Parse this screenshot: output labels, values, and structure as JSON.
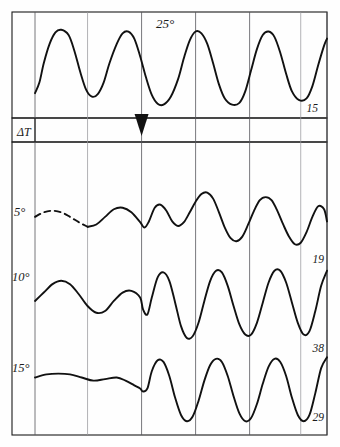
{
  "figure": {
    "background": "#fefefe",
    "ink_color": "#111111",
    "grid_color": "#55555a"
  },
  "chart_data": {
    "type": "line",
    "title": "",
    "xlabel": "",
    "ylabel": "",
    "grid": true,
    "legend": "none",
    "panels": [
      {
        "name": "upper-panel",
        "trace_label": "25°",
        "right_label": "15",
        "xlim": [
          0,
          100
        ],
        "ylim": [
          0,
          1
        ],
        "cycles": 6,
        "description": "regular high-amplitude oscillation",
        "points_x": [
          0,
          1.5,
          3,
          5,
          7,
          9,
          11.5,
          13.5,
          15.5,
          17.5,
          19.5,
          21.5,
          23.5,
          25.5,
          28,
          30,
          32,
          34,
          36,
          38,
          40,
          42,
          44,
          46.5,
          49,
          51,
          53,
          55,
          57,
          59,
          61,
          63,
          65,
          67.5,
          70,
          72,
          74,
          76,
          78,
          80,
          82,
          84,
          86,
          88,
          90.5,
          93,
          95,
          97,
          99,
          100
        ],
        "points_y": [
          0.18,
          0.3,
          0.52,
          0.74,
          0.87,
          0.9,
          0.84,
          0.66,
          0.42,
          0.22,
          0.14,
          0.17,
          0.3,
          0.52,
          0.74,
          0.86,
          0.88,
          0.8,
          0.6,
          0.36,
          0.16,
          0.06,
          0.05,
          0.14,
          0.34,
          0.58,
          0.78,
          0.88,
          0.86,
          0.74,
          0.52,
          0.28,
          0.12,
          0.05,
          0.07,
          0.2,
          0.44,
          0.68,
          0.84,
          0.88,
          0.82,
          0.64,
          0.4,
          0.2,
          0.1,
          0.12,
          0.26,
          0.5,
          0.72,
          0.8
        ]
      },
      {
        "name": "delta-t-band",
        "label": "ΔT",
        "marker": "triangle-down",
        "marker_x_pct": 36.5
      },
      {
        "name": "lower-panel-trace-5deg",
        "trace_label": "5°",
        "right_label": "19",
        "dashed_until_pct": 18,
        "description": "low amplitude before marker, growing oscillation after",
        "points_x": [
          0,
          3,
          6,
          9,
          12,
          15,
          18,
          21,
          24,
          27,
          30,
          33,
          36,
          37.5,
          39,
          41,
          43,
          45,
          47,
          49,
          51,
          53,
          55,
          57,
          59,
          61,
          63,
          65,
          67,
          69,
          71,
          73,
          75,
          77,
          79,
          81,
          83,
          85,
          87,
          89,
          91,
          93,
          95,
          97,
          99,
          100
        ],
        "points_y": [
          0.62,
          0.68,
          0.7,
          0.68,
          0.62,
          0.55,
          0.49,
          0.52,
          0.62,
          0.72,
          0.74,
          0.68,
          0.55,
          0.48,
          0.56,
          0.74,
          0.78,
          0.7,
          0.56,
          0.5,
          0.55,
          0.68,
          0.82,
          0.92,
          0.94,
          0.86,
          0.68,
          0.48,
          0.34,
          0.3,
          0.36,
          0.52,
          0.7,
          0.84,
          0.88,
          0.84,
          0.7,
          0.52,
          0.36,
          0.26,
          0.28,
          0.42,
          0.62,
          0.76,
          0.72,
          0.56
        ]
      },
      {
        "name": "lower-panel-trace-10deg",
        "trace_label": "10°",
        "right_label": "38",
        "dashed_until_pct": 0,
        "description": "moderate amplitude before marker, large amplitude after",
        "points_x": [
          0,
          3,
          6,
          9,
          12,
          15,
          18,
          21,
          24,
          27,
          30,
          33,
          36,
          37,
          38.5,
          40,
          42,
          44,
          46,
          48,
          50,
          52,
          54,
          56,
          58,
          60,
          62,
          64,
          66,
          68,
          70,
          72,
          74,
          76,
          78,
          80,
          82,
          84,
          86,
          88,
          90,
          92,
          94,
          96,
          98,
          100
        ],
        "points_y": [
          0.56,
          0.66,
          0.76,
          0.8,
          0.76,
          0.64,
          0.5,
          0.42,
          0.44,
          0.56,
          0.66,
          0.68,
          0.6,
          0.46,
          0.4,
          0.6,
          0.84,
          0.9,
          0.8,
          0.54,
          0.26,
          0.12,
          0.14,
          0.3,
          0.56,
          0.8,
          0.92,
          0.9,
          0.74,
          0.5,
          0.28,
          0.16,
          0.16,
          0.3,
          0.54,
          0.78,
          0.92,
          0.92,
          0.78,
          0.54,
          0.3,
          0.16,
          0.2,
          0.44,
          0.74,
          0.92
        ]
      },
      {
        "name": "lower-panel-trace-15deg",
        "trace_label": "15°",
        "right_label": "29",
        "dashed_until_pct": 0,
        "description": "nearly flat before marker, strong oscillation after",
        "points_x": [
          0,
          4,
          8,
          12,
          16,
          20,
          24,
          28,
          31,
          34,
          36,
          37,
          38.5,
          40,
          42,
          44,
          46,
          48,
          50,
          52,
          54,
          56,
          58,
          60,
          62,
          64,
          66,
          68,
          70,
          72,
          74,
          76,
          78,
          80,
          82,
          84,
          86,
          88,
          90,
          92,
          94,
          96,
          98,
          100
        ],
        "points_y": [
          0.66,
          0.7,
          0.71,
          0.7,
          0.66,
          0.62,
          0.64,
          0.66,
          0.62,
          0.56,
          0.52,
          0.48,
          0.52,
          0.74,
          0.88,
          0.86,
          0.68,
          0.4,
          0.18,
          0.1,
          0.16,
          0.36,
          0.62,
          0.82,
          0.9,
          0.86,
          0.68,
          0.42,
          0.2,
          0.1,
          0.14,
          0.32,
          0.58,
          0.8,
          0.9,
          0.86,
          0.68,
          0.4,
          0.18,
          0.1,
          0.18,
          0.46,
          0.78,
          0.92
        ]
      }
    ],
    "gridlines_x_pct": [
      0,
      18,
      36.5,
      55,
      73.5,
      91,
      100
    ],
    "axis_labels_left": [
      "5°",
      "10°",
      "15°"
    ],
    "axis_labels_right": [
      "15",
      "19",
      "38",
      "29"
    ]
  },
  "layout": {
    "frame": {
      "x": 12,
      "y": 12,
      "w": 315,
      "h": 423
    },
    "upper_panel": {
      "x": 12,
      "y": 12,
      "w": 315,
      "h": 106
    },
    "band": {
      "x": 12,
      "y": 118,
      "w": 315,
      "h": 24
    },
    "lower_panel": {
      "x": 12,
      "y": 142,
      "w": 315,
      "h": 293
    },
    "plot_left_x": 35,
    "plot_right_x": 327,
    "band_label_divider_x": 35
  }
}
